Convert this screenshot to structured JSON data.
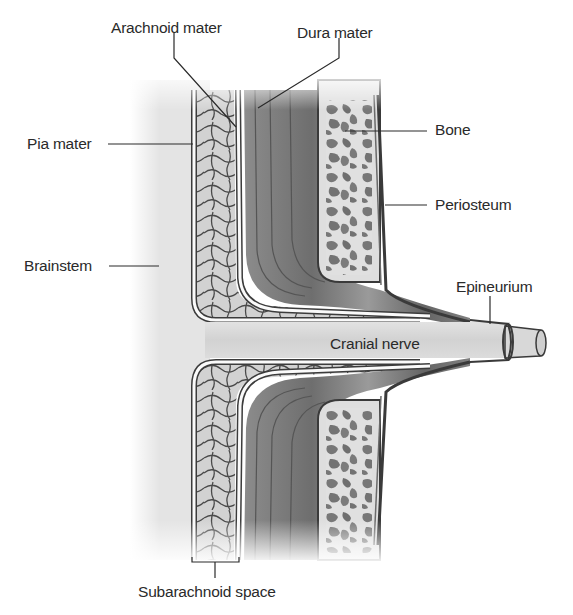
{
  "diagram": {
    "labels": {
      "arachnoid_mater": "Arachnoid mater",
      "dura_mater": "Dura mater",
      "pia_mater": "Pia mater",
      "bone": "Bone",
      "periosteum": "Periosteum",
      "brainstem": "Brainstem",
      "epineurium": "Epineurium",
      "cranial_nerve": "Cranial nerve",
      "subarachnoid_space": "Subarachnoid space"
    },
    "colors": {
      "background": "#ffffff",
      "brainstem": "#e6e6e6",
      "subarachnoid": "#d4d4d4",
      "trabeculae": "#4a4a4a",
      "membrane_white": "#fafafa",
      "membrane_dark": "#3c3c3c",
      "dura_light": "#9a9a9a",
      "dura_dark": "#5a5a5a",
      "bone": "#dedede",
      "bone_cavity": "#7a7a7a",
      "nerve": "#d9d9d9",
      "text": "#2a2a2a",
      "leader_line": "#2a2a2a"
    }
  }
}
